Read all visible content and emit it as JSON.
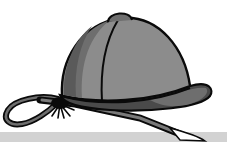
{
  "image": {
    "subject": "riding helmet with riding crop",
    "colors": {
      "background": "#ffffff",
      "floor_strip": "#d2d2d2",
      "helmet_light": "#8c8c8c",
      "helmet_mid": "#6e6e6e",
      "helmet_dark": "#4a4a4a",
      "outline": "#0a0a0a",
      "crop_gray": "#7a7a7a"
    }
  }
}
